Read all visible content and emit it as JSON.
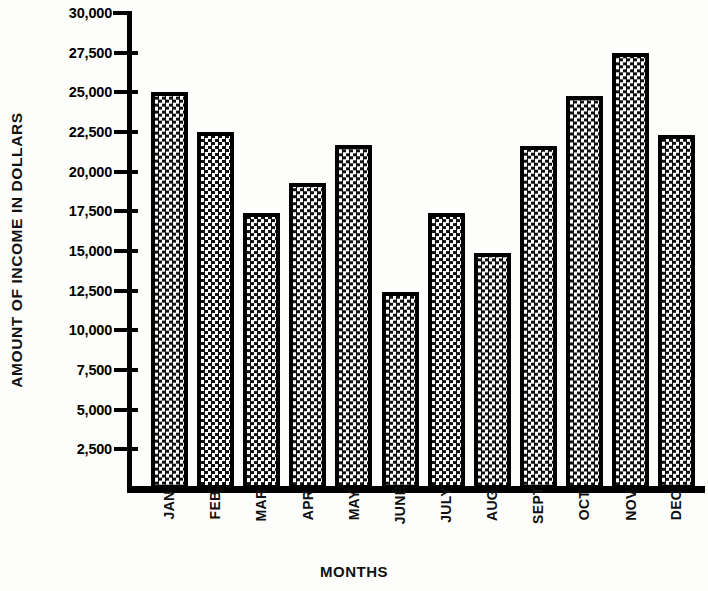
{
  "chart_data": {
    "type": "bar",
    "title": "",
    "xlabel": "MONTHS",
    "ylabel": "AMOUNT OF INCOME IN DOLLARS",
    "categories": [
      "JAN",
      "FEB",
      "MAR",
      "APR",
      "MAY",
      "JUNE",
      "JULY",
      "AUG",
      "SEPT",
      "OCT",
      "NOV",
      "DEC"
    ],
    "values": [
      25000,
      22500,
      17400,
      19300,
      21700,
      12400,
      17400,
      14900,
      21600,
      24800,
      27500,
      22300
    ],
    "series": [
      {
        "name": "Income",
        "values": [
          25000,
          22500,
          17400,
          19300,
          21700,
          12400,
          17400,
          14900,
          21600,
          24800,
          27500,
          22300
        ]
      }
    ],
    "ylim": [
      0,
      30000
    ],
    "ytick_values": [
      2500,
      5000,
      7500,
      10000,
      12500,
      15000,
      17500,
      20000,
      22500,
      25000,
      27500,
      30000
    ],
    "ytick_labels": [
      "2,500",
      "5,000",
      "7,500",
      "10,000",
      "12,500",
      "15,000",
      "17,500",
      "20,000",
      "22,500",
      "25,000",
      "27,500",
      "30,000"
    ],
    "grid": false,
    "legend": false,
    "legend_position": "none",
    "bar_fill": "checkerboard-pattern",
    "bar_border_color": "#000000",
    "background_color": "#fdfdfb",
    "text_color": "#111111"
  },
  "axes": {
    "y_title": "AMOUNT OF INCOME IN DOLLARS",
    "x_title": "MONTHS"
  }
}
